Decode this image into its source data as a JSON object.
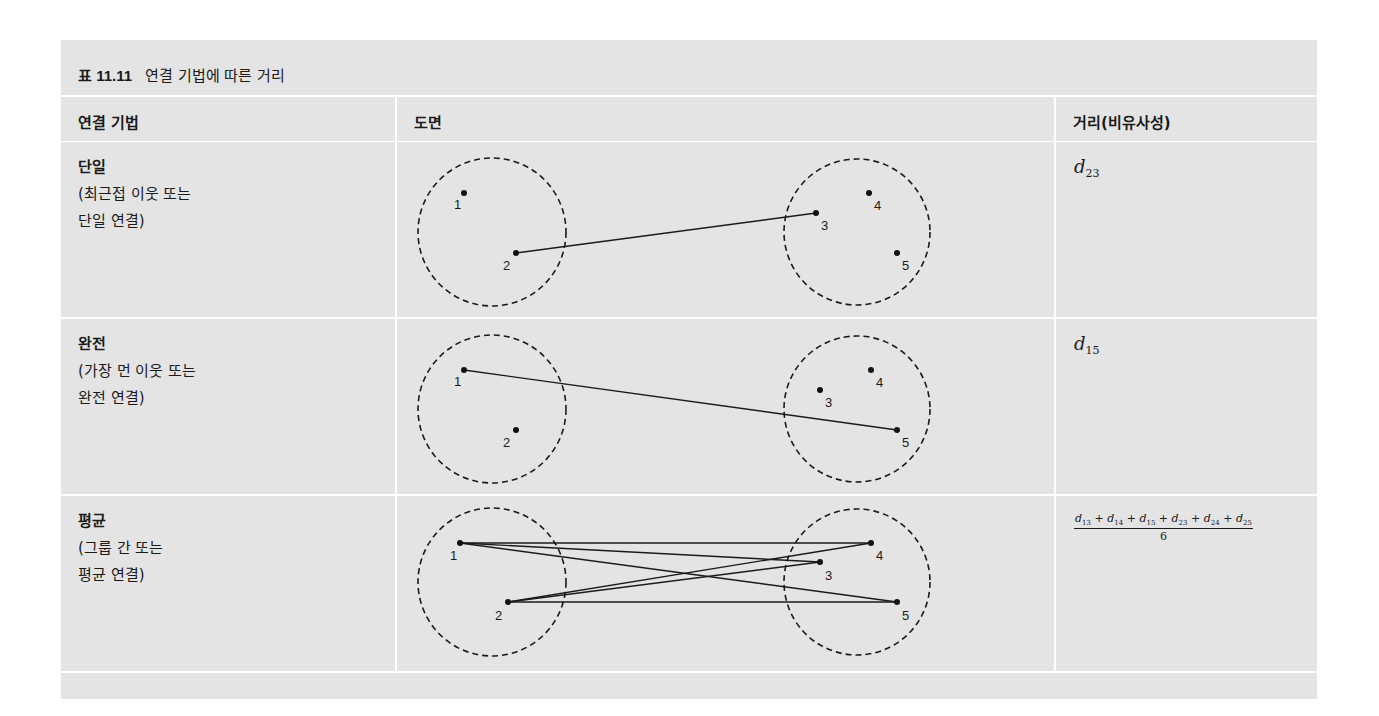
{
  "caption": {
    "number": "표 11.11",
    "title": "연결 기법에 따른 거리"
  },
  "headers": {
    "method": "연결 기법",
    "diagram": "도면",
    "distance": "거리(비유사성)"
  },
  "rows": [
    {
      "title": "단일",
      "desc_line1": "(최근접 이웃 또는",
      "desc_line2": "단일 연결)",
      "distance": {
        "symbol": "d",
        "sub": "23"
      },
      "diagram": {
        "points": [
          {
            "id": "1",
            "x": 67,
            "y": 51
          },
          {
            "id": "2",
            "x": 119,
            "y": 111
          },
          {
            "id": "3",
            "x": 419,
            "y": 71
          },
          {
            "id": "4",
            "x": 472,
            "y": 51
          },
          {
            "id": "5",
            "x": 500,
            "y": 111
          }
        ],
        "edges": [
          [
            "2",
            "3"
          ]
        ]
      }
    },
    {
      "title": "완전",
      "desc_line1": "(가장 먼 이웃 또는",
      "desc_line2": "완전 연결)",
      "distance": {
        "symbol": "d",
        "sub": "15"
      },
      "diagram": {
        "points": [
          {
            "id": "1",
            "x": 67,
            "y": 51
          },
          {
            "id": "2",
            "x": 119,
            "y": 111
          },
          {
            "id": "3",
            "x": 423,
            "y": 71
          },
          {
            "id": "4",
            "x": 474,
            "y": 51
          },
          {
            "id": "5",
            "x": 500,
            "y": 111
          }
        ],
        "edges": [
          [
            "1",
            "5"
          ]
        ]
      }
    },
    {
      "title": "평균",
      "desc_line1": "(그룹 간 또는",
      "desc_line2": "평균 연결)",
      "distance": {
        "numerator_terms": [
          {
            "symbol": "d",
            "sub": "13"
          },
          {
            "symbol": "d",
            "sub": "14"
          },
          {
            "symbol": "d",
            "sub": "15"
          },
          {
            "symbol": "d",
            "sub": "23"
          },
          {
            "symbol": "d",
            "sub": "24"
          },
          {
            "symbol": "d",
            "sub": "25"
          }
        ],
        "numerator": "d13 + d14 + d15 + d23 + d24 + d25",
        "denominator": "6"
      },
      "diagram": {
        "points": [
          {
            "id": "1",
            "x": 67,
            "y": 51
          },
          {
            "id": "2",
            "x": 119,
            "y": 111
          },
          {
            "id": "3",
            "x": 423,
            "y": 71
          },
          {
            "id": "4",
            "x": 474,
            "y": 51
          },
          {
            "id": "5",
            "x": 500,
            "y": 111
          }
        ],
        "edges": [
          [
            "1",
            "3"
          ],
          [
            "1",
            "4"
          ],
          [
            "1",
            "5"
          ],
          [
            "2",
            "3"
          ],
          [
            "2",
            "4"
          ],
          [
            "2",
            "5"
          ]
        ]
      }
    }
  ],
  "colors": {
    "cell_background": "#e4e4e4",
    "grid_lines": "#ffffff",
    "ink": "#1a1a1a"
  }
}
